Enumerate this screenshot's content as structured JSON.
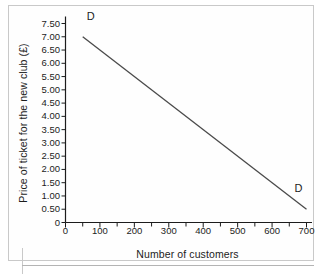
{
  "figure": {
    "background_color": "#fefefe",
    "frame_color": "#c9c9c9"
  },
  "chart_data": {
    "type": "line",
    "title": "",
    "xlabel": "Number of customers",
    "ylabel": "Price of ticket for the new club (£)",
    "xlim": [
      0,
      700
    ],
    "ylim": [
      0,
      7.5
    ],
    "grid": false,
    "legend": "none",
    "line_color": "#4a4a4a",
    "axis_color": "#1c1c1c",
    "x_ticks": [
      0,
      100,
      200,
      300,
      400,
      500,
      600,
      700
    ],
    "x_tick_labels": [
      "0",
      "100",
      "200",
      "300",
      "400",
      "500",
      "600",
      "700"
    ],
    "x_minor_ticks": [
      50,
      150,
      250,
      350,
      450,
      550,
      650
    ],
    "y_ticks": [
      0,
      0.5,
      1.0,
      1.5,
      2.0,
      2.5,
      3.0,
      3.5,
      4.0,
      4.5,
      5.0,
      5.5,
      6.0,
      6.5,
      7.0,
      7.5
    ],
    "y_tick_labels": [
      "0",
      "0.50",
      "1.00",
      "1.50",
      "2.00",
      "2.50",
      "3.00",
      "3.50",
      "4.00",
      "4.50",
      "5.00",
      "5.50",
      "6.00",
      "6.50",
      "7.00",
      "7.50"
    ],
    "series": [
      {
        "name": "D",
        "type": "line",
        "x": [
          50,
          700
        ],
        "y": [
          7.0,
          0.5
        ],
        "annotations": [
          {
            "text": "D",
            "x": 50,
            "y": 7.5,
            "position": "above-start"
          },
          {
            "text": "D",
            "x": 700,
            "y": 1.0,
            "position": "above-end"
          }
        ]
      }
    ]
  }
}
